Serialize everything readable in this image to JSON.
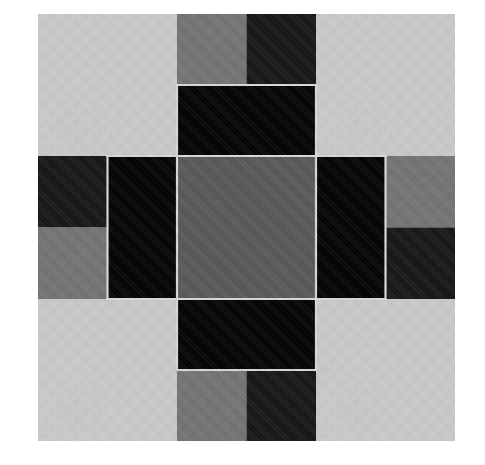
{
  "image": {
    "title": "Eight-Pointed Star Quilt Block",
    "subject": "quilt block patchwork pattern",
    "width": 485,
    "height": 465,
    "page_background": "#ffffff"
  },
  "block": {
    "label": "quilt block",
    "x": 38,
    "y": 14,
    "width": 417,
    "height": 427,
    "grid_columns": 6,
    "grid_rows": 6
  },
  "palette": {
    "background_fabric": "#c9c9c9",
    "medium_gray_fabric": "#727272",
    "dark_gray_fabric": "#565656",
    "near_black_fabric": "#131313",
    "black_fabric": "#000000",
    "seam_line": "#d8d8d8"
  },
  "patches": [
    {
      "name": "background-top-left-corner",
      "fabric": "background_fabric",
      "shape": "square",
      "points": "0,0 139,0 139,142 0,142"
    },
    {
      "name": "background-top-right-corner",
      "fabric": "background_fabric",
      "shape": "square",
      "points": "278,0 417,0 417,142 278,142"
    },
    {
      "name": "background-bottom-left-corner",
      "fabric": "background_fabric",
      "shape": "square",
      "points": "0,285 139,285 139,427 0,427"
    },
    {
      "name": "background-bottom-right-corner",
      "fabric": "background_fabric",
      "shape": "square",
      "points": "278,285 417,285 417,427 278,427"
    },
    {
      "name": "star-point-north-light-half",
      "fabric": "medium_gray_fabric",
      "shape": "triangle",
      "points": "139,0 208.5,0 208.5,142 139,142"
    },
    {
      "name": "star-point-north-dark-half",
      "fabric": "near_black_fabric",
      "shape": "triangle",
      "points": "278,0 208.5,0 208.5,142 278,142"
    },
    {
      "name": "star-point-west-dark-half",
      "fabric": "near_black_fabric",
      "shape": "triangle",
      "points": "0,142 0,213.5 139,213.5 139,142"
    },
    {
      "name": "star-point-west-light-half",
      "fabric": "medium_gray_fabric",
      "shape": "triangle",
      "points": "0,285 0,213.5 139,213.5 139,285"
    },
    {
      "name": "star-point-east-light-half",
      "fabric": "medium_gray_fabric",
      "shape": "triangle",
      "points": "417,142 417,213.5 278,213.5 278,142"
    },
    {
      "name": "star-point-east-dark-half",
      "fabric": "near_black_fabric",
      "shape": "triangle",
      "points": "417,285 417,213.5 278,213.5 278,285"
    },
    {
      "name": "star-point-south-light-half",
      "fabric": "medium_gray_fabric",
      "shape": "triangle",
      "points": "139,427 208.5,427 208.5,285 139,285"
    },
    {
      "name": "star-point-south-dark-half",
      "fabric": "near_black_fabric",
      "shape": "triangle",
      "points": "278,427 208.5,427 208.5,285 278,285"
    },
    {
      "name": "corner-square-north",
      "fabric": "black_fabric",
      "shape": "square",
      "points": "139,71 278,71 278,142 139,142"
    },
    {
      "name": "corner-square-west",
      "fabric": "black_fabric",
      "shape": "square",
      "points": "69.5,142 139,142 139,285 69.5,285"
    },
    {
      "name": "corner-square-east",
      "fabric": "black_fabric",
      "shape": "square",
      "points": "278,142 347.5,142 347.5,285 278,285"
    },
    {
      "name": "corner-square-south",
      "fabric": "black_fabric",
      "shape": "square",
      "points": "139,285 278,285 278,356 139,356"
    },
    {
      "name": "center-square",
      "fabric": "dark_gray_fabric",
      "shape": "square",
      "points": "139,142 278,142 278,285 139,285"
    }
  ]
}
